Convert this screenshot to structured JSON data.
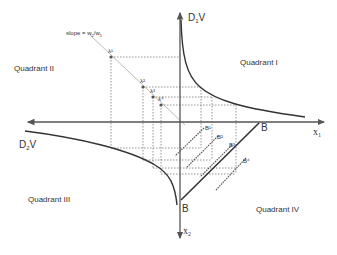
{
  "diagram": {
    "quadrants": {
      "q1": "Quadrant I",
      "q2": "Quadrant II",
      "q3": "Quadrant III",
      "q4": "Quadrant IV"
    },
    "axes": {
      "y_up_label": {
        "main": "D",
        "sub": "1",
        "suffix": "V"
      },
      "x_left_label": {
        "main": "D",
        "sub": "2",
        "suffix": "V"
      },
      "x_right_label": {
        "main": "x",
        "sub": "1"
      },
      "y_down_label": {
        "main": "x",
        "sub": "2"
      }
    },
    "slope_label": {
      "prefix": "slope = w",
      "sub1": "2",
      "mid": "/w",
      "sub2": "1"
    },
    "budget_line_labels": {
      "top": "B",
      "bottom": "B"
    },
    "lambda_labels": [
      "λ¹",
      "λ²",
      "λ³",
      "λ⁴"
    ],
    "shifted_budget_labels": [
      "B¹",
      "B²",
      "B³",
      "B⁴"
    ],
    "colors": {
      "axis": "#555555",
      "curve": "#333333",
      "dotted": "#777777",
      "slope_line": "#bbbbbb",
      "text": "#333333"
    }
  }
}
